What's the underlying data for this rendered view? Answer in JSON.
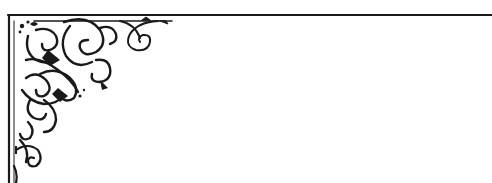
{
  "figure": {
    "description": "Decorative filigree corner ornament with frame border",
    "ink_color": "#1a1a1a",
    "background_color": "#ffffff"
  }
}
